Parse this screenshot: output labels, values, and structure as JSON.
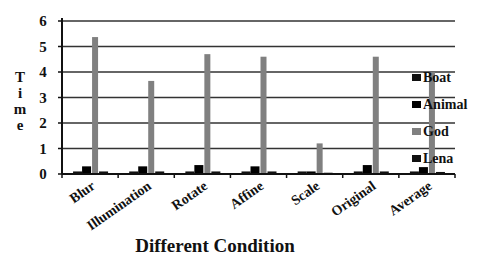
{
  "chart_data": {
    "type": "bar",
    "title": "",
    "xlabel": "Different Condition",
    "ylabel": "Time",
    "ylim": [
      0,
      6
    ],
    "yticks": [
      0,
      1,
      2,
      3,
      4,
      5,
      6
    ],
    "grid": true,
    "legend_position": "right",
    "categories": [
      "Blur",
      "Illumination",
      "Rotate",
      "Affine",
      "Scale",
      "Original",
      "Average"
    ],
    "series": [
      {
        "name": "Boat",
        "color": "#111111",
        "values": [
          0.1,
          0.1,
          0.1,
          0.1,
          0.1,
          0.1,
          0.1
        ]
      },
      {
        "name": "Animal",
        "color": "#000000",
        "values": [
          0.3,
          0.3,
          0.35,
          0.3,
          0.1,
          0.35,
          0.27
        ]
      },
      {
        "name": "God",
        "color": "#808080",
        "values": [
          5.37,
          3.65,
          4.7,
          4.6,
          1.2,
          4.6,
          4.0
        ]
      },
      {
        "name": "Lena",
        "color": "#111111",
        "values": [
          0.1,
          0.1,
          0.1,
          0.1,
          0.05,
          0.1,
          0.08
        ]
      }
    ]
  },
  "legend": [
    "Boat",
    "Animal",
    "God",
    "Lena"
  ],
  "axis": {
    "ylabel_letters": [
      "T",
      "i",
      "m",
      "e"
    ],
    "xtitle": "Different Condition"
  }
}
